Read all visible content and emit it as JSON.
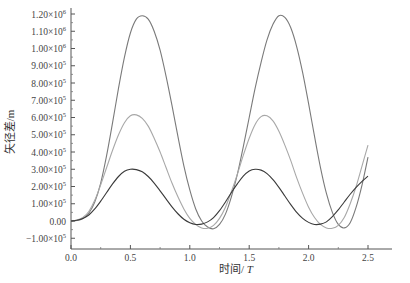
{
  "chart_data": {
    "type": "line",
    "title": "",
    "xlabel": "时间/T",
    "ylabel": "矢径差/m",
    "xlim": [
      0.0,
      2.7
    ],
    "ylim": [
      -130000,
      1230000
    ],
    "grid": false,
    "legend": null,
    "x_ticks": [
      {
        "value": 0.0,
        "label": "0.0"
      },
      {
        "value": 0.5,
        "label": "0.5"
      },
      {
        "value": 1.0,
        "label": "1.0"
      },
      {
        "value": 1.5,
        "label": "1.5"
      },
      {
        "value": 2.0,
        "label": "2.0"
      },
      {
        "value": 2.5,
        "label": "2.5"
      }
    ],
    "y_ticks": [
      {
        "value": -100000,
        "mant": "−1.00×10",
        "exp": "5"
      },
      {
        "value": 0,
        "mant": "0.00",
        "exp": ""
      },
      {
        "value": 100000,
        "mant": "1.00×10",
        "exp": "5"
      },
      {
        "value": 200000,
        "mant": "2.00×10",
        "exp": "5"
      },
      {
        "value": 300000,
        "mant": "3.00×10",
        "exp": "5"
      },
      {
        "value": 400000,
        "mant": "4.00×10",
        "exp": "5"
      },
      {
        "value": 500000,
        "mant": "5.00×10",
        "exp": "5"
      },
      {
        "value": 600000,
        "mant": "6.00×10",
        "exp": "5"
      },
      {
        "value": 700000,
        "mant": "7.00×10",
        "exp": "5"
      },
      {
        "value": 800000,
        "mant": "8.00×10",
        "exp": "5"
      },
      {
        "value": 900000,
        "mant": "9.00×10",
        "exp": "5"
      },
      {
        "value": 1000000,
        "mant": "1.00×10",
        "exp": "6"
      },
      {
        "value": 1100000,
        "mant": "1.10×10",
        "exp": "6"
      },
      {
        "value": 1200000,
        "mant": "1.20×10",
        "exp": "6"
      }
    ],
    "series": [
      {
        "name": "curve-large",
        "color": "#7a7a7a",
        "x": [
          0.0,
          0.05,
          0.1,
          0.15,
          0.2,
          0.25,
          0.3,
          0.35,
          0.4,
          0.45,
          0.5,
          0.55,
          0.6,
          0.65,
          0.7,
          0.75,
          0.8,
          0.85,
          0.9,
          0.95,
          1.0,
          1.05,
          1.1,
          1.15,
          1.2,
          1.25,
          1.3,
          1.35,
          1.4,
          1.45,
          1.5,
          1.55,
          1.6,
          1.65,
          1.7,
          1.75,
          1.8,
          1.85,
          1.9,
          1.95,
          2.0,
          2.05,
          2.1,
          2.15,
          2.2,
          2.25,
          2.3,
          2.35,
          2.4,
          2.45,
          2.5
        ],
        "values": [
          0,
          3000,
          15000,
          45000,
          110000,
          220000,
          380000,
          570000,
          770000,
          950000,
          1090000,
          1170000,
          1190000,
          1170000,
          1100000,
          990000,
          840000,
          670000,
          490000,
          320000,
          180000,
          70000,
          0,
          -35000,
          -45000,
          -20000,
          40000,
          140000,
          270000,
          430000,
          600000,
          770000,
          920000,
          1050000,
          1140000,
          1190000,
          1180000,
          1120000,
          1010000,
          860000,
          680000,
          490000,
          310000,
          160000,
          50000,
          -20000,
          -40000,
          -10000,
          80000,
          210000,
          370000
        ]
      },
      {
        "name": "curve-medium",
        "color": "#a8a8a8",
        "x": [
          0.0,
          0.05,
          0.1,
          0.15,
          0.2,
          0.25,
          0.3,
          0.35,
          0.4,
          0.45,
          0.5,
          0.55,
          0.6,
          0.65,
          0.7,
          0.75,
          0.8,
          0.85,
          0.9,
          0.95,
          1.0,
          1.05,
          1.1,
          1.15,
          1.2,
          1.25,
          1.3,
          1.35,
          1.4,
          1.45,
          1.5,
          1.55,
          1.6,
          1.65,
          1.7,
          1.75,
          1.8,
          1.85,
          1.9,
          1.95,
          2.0,
          2.05,
          2.1,
          2.15,
          2.2,
          2.25,
          2.3,
          2.35,
          2.4,
          2.45,
          2.5
        ],
        "values": [
          0,
          5000,
          20000,
          55000,
          120000,
          210000,
          310000,
          410000,
          500000,
          570000,
          610000,
          615000,
          595000,
          550000,
          480000,
          400000,
          310000,
          220000,
          140000,
          70000,
          15000,
          -20000,
          -40000,
          -42000,
          -25000,
          15000,
          80000,
          170000,
          270000,
          380000,
          480000,
          560000,
          605000,
          610000,
          580000,
          520000,
          440000,
          350000,
          250000,
          160000,
          80000,
          20000,
          -20000,
          -40000,
          -42000,
          -25000,
          20000,
          100000,
          200000,
          320000,
          440000
        ]
      },
      {
        "name": "curve-small",
        "color": "#3a3a3a",
        "x": [
          0.0,
          0.05,
          0.1,
          0.15,
          0.2,
          0.25,
          0.3,
          0.35,
          0.4,
          0.45,
          0.5,
          0.55,
          0.6,
          0.65,
          0.7,
          0.75,
          0.8,
          0.85,
          0.9,
          0.95,
          1.0,
          1.05,
          1.1,
          1.15,
          1.2,
          1.25,
          1.3,
          1.35,
          1.4,
          1.45,
          1.5,
          1.55,
          1.6,
          1.65,
          1.7,
          1.75,
          1.8,
          1.85,
          1.9,
          1.95,
          2.0,
          2.05,
          2.1,
          2.15,
          2.2,
          2.25,
          2.3,
          2.35,
          2.4,
          2.45,
          2.5
        ],
        "values": [
          0,
          4000,
          15000,
          35000,
          70000,
          115000,
          165000,
          215000,
          258000,
          288000,
          300000,
          298000,
          285000,
          258000,
          220000,
          175000,
          128000,
          82000,
          42000,
          10000,
          -10000,
          -20000,
          -18000,
          -5000,
          20000,
          60000,
          110000,
          165000,
          215000,
          260000,
          290000,
          300000,
          295000,
          275000,
          240000,
          195000,
          145000,
          95000,
          50000,
          15000,
          -8000,
          -20000,
          -18000,
          -5000,
          25000,
          65000,
          110000,
          155000,
          195000,
          230000,
          260000
        ]
      }
    ]
  }
}
